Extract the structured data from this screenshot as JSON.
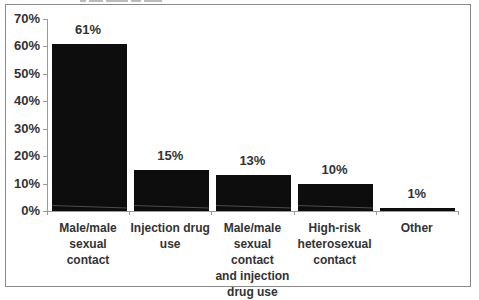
{
  "chart_data": {
    "type": "bar",
    "title": "",
    "xlabel": "",
    "ylabel": "",
    "categories": [
      "Male/male\nsexual contact",
      "Injection drug\nuse",
      "Male/male\nsexual contact\nand injection\ndrug use",
      "High-risk\nheterosexual\ncontact",
      "Other"
    ],
    "values": [
      61,
      15,
      13,
      10,
      1
    ],
    "value_labels": [
      "61%",
      "15%",
      "13%",
      "10%",
      "1%"
    ],
    "ylim": [
      0,
      70
    ],
    "yticks": [
      "0%",
      "10%",
      "20%",
      "30%",
      "40%",
      "50%",
      "60%",
      "70%"
    ],
    "grid": false,
    "legend": null,
    "bar_color": "#0d0d0d"
  }
}
